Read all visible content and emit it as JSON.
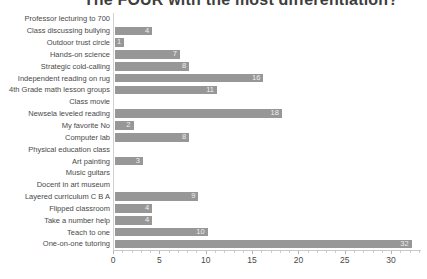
{
  "title": "The FOUR with the most differentiation?",
  "colors": {
    "bar": "#979797",
    "bar_value_label": "#efefef",
    "axis_line": "#c9c9c9",
    "text": "#4a4a4a",
    "title_text": "#3e3e3e",
    "background": "#ffffff"
  },
  "chart_data": {
    "type": "bar",
    "orientation": "horizontal",
    "title": "The FOUR with the most differentiation?",
    "categories": [
      "Professor lecturing to 700",
      "Class discussing bullying",
      "Outdoor trust circle",
      "Hands-on science",
      "Strategic cold-calling",
      "Independent reading on rug",
      "4th Grade math lesson groups",
      "Class movie",
      "Newsela leveled reading",
      "My favorite No",
      "Computer lab",
      "Physical education class",
      "Art painting",
      "Music guitars",
      "Docent in art museum",
      "Layered curriculum C B A",
      "Flipped classroom",
      "Take a number help",
      "Teach to one",
      "One-on-one tutoring"
    ],
    "values": [
      0,
      4,
      1,
      7,
      8,
      16,
      11,
      0,
      18,
      2,
      8,
      0,
      3,
      0,
      0,
      9,
      4,
      4,
      10,
      32
    ],
    "value_labels": [
      "",
      "4",
      "1",
      "7",
      "8",
      "16",
      "11",
      "",
      "18",
      "2",
      "8",
      "",
      "3",
      "",
      "",
      "9",
      "4",
      "4",
      "10",
      "32"
    ],
    "xlabel": "",
    "ylabel": "",
    "xlim": [
      0,
      33
    ],
    "x_ticks": [
      0,
      5,
      10,
      15,
      20,
      25,
      30
    ],
    "grid": "off",
    "legend": "none",
    "value_label_position": "inside-end"
  }
}
